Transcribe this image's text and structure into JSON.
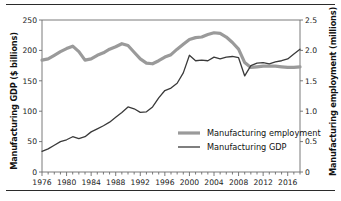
{
  "chart_data": {
    "type": "line",
    "title": "",
    "xlabel": "",
    "grid": false,
    "legend_position": "inside-lower-right",
    "x_tick_labels": [
      "1976",
      "1980",
      "1984",
      "1988",
      "1992",
      "1996",
      "2000",
      "2004",
      "2008",
      "2012",
      "2016"
    ],
    "x_tick_values": [
      1976,
      1980,
      1984,
      1988,
      1992,
      1996,
      2000,
      2004,
      2008,
      2012,
      2016
    ],
    "xlim": [
      1976,
      2018
    ],
    "minor_x_tick_interval": 1,
    "axes": [
      {
        "side": "left",
        "label": "Manufacturing GDP ($ billions)",
        "ticks": [
          "0",
          "50",
          "100",
          "150",
          "200",
          "250"
        ],
        "tick_values": [
          0,
          50,
          100,
          150,
          200,
          250
        ],
        "lim": [
          0,
          250
        ]
      },
      {
        "side": "right",
        "label": "Manufacturing employment (millions)",
        "ticks": [
          "0",
          "0.5",
          "1.0",
          "1.5",
          "2.0",
          "2.5"
        ],
        "tick_values": [
          0,
          0.5,
          1.0,
          1.5,
          2.0,
          2.5
        ],
        "lim": [
          0,
          2.5
        ]
      }
    ],
    "x": [
      1976,
      1977,
      1978,
      1979,
      1980,
      1981,
      1982,
      1983,
      1984,
      1985,
      1986,
      1987,
      1988,
      1989,
      1990,
      1991,
      1992,
      1993,
      1994,
      1995,
      1996,
      1997,
      1998,
      1999,
      2000,
      2001,
      2002,
      2003,
      2004,
      2005,
      2006,
      2007,
      2008,
      2009,
      2010,
      2011,
      2012,
      2013,
      2014,
      2015,
      2016,
      2017,
      2018
    ],
    "series": [
      {
        "name": "Manufacturing employment",
        "axis": "right",
        "units": "millions",
        "color": "#9a9a9a",
        "line_width": 3.2,
        "values": [
          1.84,
          1.86,
          1.92,
          1.98,
          2.03,
          2.07,
          1.98,
          1.84,
          1.86,
          1.92,
          1.96,
          2.02,
          2.06,
          2.11,
          2.08,
          1.97,
          1.86,
          1.79,
          1.78,
          1.83,
          1.89,
          1.93,
          2.02,
          2.1,
          2.18,
          2.21,
          2.22,
          2.26,
          2.29,
          2.28,
          2.22,
          2.13,
          2.02,
          1.8,
          1.72,
          1.73,
          1.74,
          1.74,
          1.74,
          1.73,
          1.72,
          1.72,
          1.73
        ]
      },
      {
        "name": "Manufacturing GDP",
        "axis": "left",
        "units": "$ billions",
        "color": "#3a3a3a",
        "line_width": 1.3,
        "values": [
          34,
          38,
          44,
          50,
          53,
          58,
          55,
          58,
          66,
          71,
          76,
          82,
          90,
          98,
          107,
          104,
          98,
          99,
          107,
          122,
          134,
          138,
          146,
          163,
          192,
          183,
          184,
          183,
          189,
          186,
          189,
          190,
          188,
          158,
          175,
          179,
          180,
          178,
          181,
          183,
          186,
          194,
          202
        ]
      }
    ],
    "legend": [
      {
        "label": "Manufacturing employment",
        "color": "#9a9a9a",
        "line_width": 3.2
      },
      {
        "label": "Manufacturing GDP",
        "color": "#3a3a3a",
        "line_width": 1.3
      }
    ]
  },
  "style": {
    "axis_color": "#6b6b6b",
    "text_color": "#111111",
    "rule_color": "#2b2b2b",
    "background": "#ffffff"
  }
}
